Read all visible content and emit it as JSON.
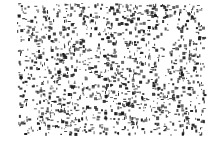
{
  "image": {
    "description": "black speckle / random dot texture on white background",
    "background_color": "#ffffff",
    "dot_color": "#1a1a1a",
    "region": {
      "x": 17,
      "y": 3,
      "width": 187,
      "height": 131
    },
    "dot_count": 1400,
    "dot_size_range": [
      1,
      3
    ],
    "seed": 12345
  }
}
